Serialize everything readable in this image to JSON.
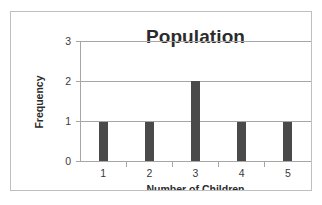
{
  "chart_data": {
    "type": "bar",
    "title": "Population",
    "xlabel": "Number of Children",
    "ylabel": "Frequency",
    "categories": [
      "1",
      "2",
      "3",
      "4",
      "5"
    ],
    "values": [
      1,
      1,
      2,
      1,
      1
    ],
    "ylim": [
      0,
      3
    ],
    "y_ticks": [
      "3",
      "2",
      "1",
      "0"
    ],
    "grid": "horizontal",
    "legend": "none",
    "series": [
      {
        "name": "Frequency",
        "values": [
          1,
          1,
          2,
          1,
          1
        ]
      }
    ],
    "colors": {
      "bar": "#4a4a4a",
      "gridline": "#a6a6a6",
      "axis": "#a6a6a6",
      "frame": "#bfbfbf",
      "text": "#2b2b2b",
      "background": "#ffffff"
    }
  }
}
